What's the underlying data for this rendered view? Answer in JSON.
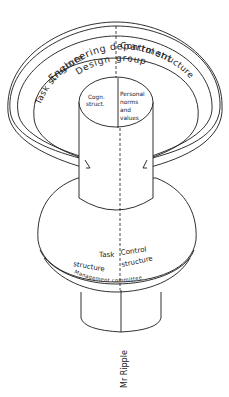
{
  "diagram": {
    "outer_ring": {
      "title": "Engineering department",
      "left_label": "Task structure",
      "right_label": "Control structure"
    },
    "middle_ring": {
      "title_left": "Design",
      "title_right": "group"
    },
    "core": {
      "left_line1": "Cogn.",
      "left_line2": "struct.",
      "right_line1": "Personal",
      "right_line2": "norms",
      "right_line3": "and",
      "right_line4": "values"
    },
    "lower_band": {
      "left_line1": "Task",
      "right_line1": "Control",
      "left_line2": "structure",
      "right_line2": "structure",
      "title": "Management committee"
    },
    "stem_label": "Mr Ripple"
  }
}
